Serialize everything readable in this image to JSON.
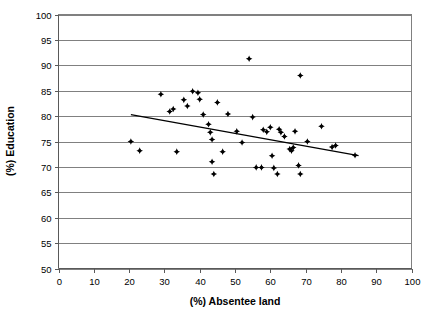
{
  "chart_data": {
    "type": "scatter",
    "title": "",
    "xlabel": "(%) Absentee land",
    "ylabel": "(%) Education",
    "xlim": [
      0,
      100
    ],
    "ylim": [
      50,
      100
    ],
    "xticks": [
      0,
      10,
      20,
      30,
      40,
      50,
      60,
      70,
      80,
      90,
      100
    ],
    "yticks": [
      50,
      55,
      60,
      65,
      70,
      75,
      80,
      85,
      90,
      95,
      100
    ],
    "grid": "horizontal",
    "legend": "none",
    "marker_color": "#000000",
    "gridline_color": "#808080",
    "trendline": {
      "visible": true,
      "color": "#000000",
      "x_start": 20.5,
      "y_start": 80.3,
      "x_end": 85.0,
      "y_end": 72.2
    },
    "points": [
      {
        "x": 20.5,
        "y": 75.0
      },
      {
        "x": 23.0,
        "y": 73.2
      },
      {
        "x": 29.0,
        "y": 84.3
      },
      {
        "x": 31.5,
        "y": 80.9
      },
      {
        "x": 32.5,
        "y": 81.4
      },
      {
        "x": 33.5,
        "y": 73.0
      },
      {
        "x": 35.5,
        "y": 83.2
      },
      {
        "x": 36.5,
        "y": 82.0
      },
      {
        "x": 38.0,
        "y": 84.9
      },
      {
        "x": 39.5,
        "y": 84.6
      },
      {
        "x": 40.0,
        "y": 83.3
      },
      {
        "x": 41.0,
        "y": 80.3
      },
      {
        "x": 42.5,
        "y": 78.4
      },
      {
        "x": 43.0,
        "y": 76.8
      },
      {
        "x": 43.5,
        "y": 75.4
      },
      {
        "x": 43.5,
        "y": 71.0
      },
      {
        "x": 44.0,
        "y": 68.6
      },
      {
        "x": 45.0,
        "y": 82.7
      },
      {
        "x": 46.5,
        "y": 73.0
      },
      {
        "x": 48.0,
        "y": 80.4
      },
      {
        "x": 50.5,
        "y": 77.0
      },
      {
        "x": 52.0,
        "y": 74.8
      },
      {
        "x": 54.0,
        "y": 91.3
      },
      {
        "x": 55.0,
        "y": 79.8
      },
      {
        "x": 56.0,
        "y": 69.9
      },
      {
        "x": 57.5,
        "y": 69.9
      },
      {
        "x": 58.0,
        "y": 77.3
      },
      {
        "x": 59.0,
        "y": 76.9
      },
      {
        "x": 60.0,
        "y": 77.8
      },
      {
        "x": 60.5,
        "y": 72.2
      },
      {
        "x": 61.0,
        "y": 69.8
      },
      {
        "x": 62.0,
        "y": 68.6
      },
      {
        "x": 62.5,
        "y": 77.4
      },
      {
        "x": 63.0,
        "y": 76.8
      },
      {
        "x": 64.0,
        "y": 76.0
      },
      {
        "x": 65.5,
        "y": 73.5
      },
      {
        "x": 66.0,
        "y": 73.2
      },
      {
        "x": 66.5,
        "y": 73.8
      },
      {
        "x": 67.0,
        "y": 77.0
      },
      {
        "x": 68.0,
        "y": 70.3
      },
      {
        "x": 68.5,
        "y": 88.0
      },
      {
        "x": 68.5,
        "y": 68.6
      },
      {
        "x": 70.5,
        "y": 75.0
      },
      {
        "x": 74.5,
        "y": 78.0
      },
      {
        "x": 77.5,
        "y": 73.9
      },
      {
        "x": 78.5,
        "y": 74.2
      },
      {
        "x": 84.0,
        "y": 72.3
      }
    ]
  }
}
